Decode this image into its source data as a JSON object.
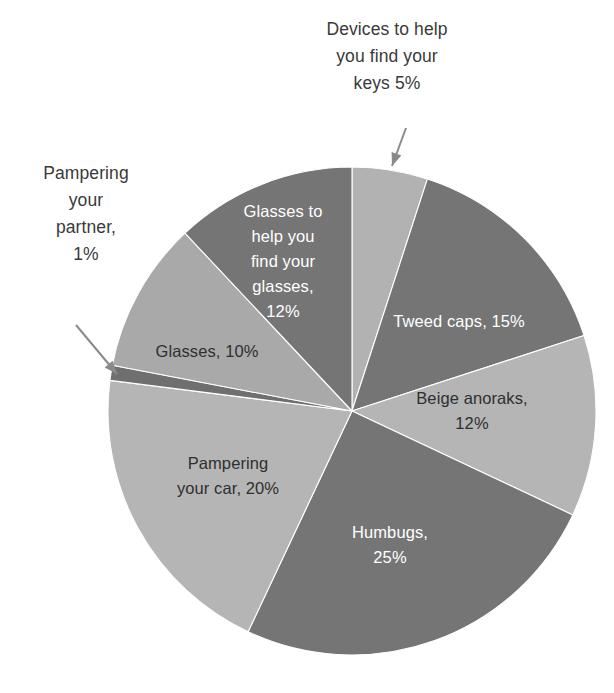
{
  "chart_data": {
    "type": "pie",
    "title": "",
    "subtitle": "",
    "xlabel": "",
    "ylabel": "",
    "legend_position": "none",
    "grid": false,
    "total": 100,
    "units": "%",
    "start_angle_deg": 0,
    "direction": "clockwise",
    "categories": [
      "Devices to help you find your keys",
      "Tweed caps",
      "Beige anoraks",
      "Humbugs",
      "Pampering your car",
      "Pampering your partner",
      "Glasses",
      "Glasses to help you find your glasses"
    ],
    "values": [
      5,
      15,
      12,
      25,
      20,
      1,
      10,
      12
    ],
    "slices": [
      {
        "name": "devices-to-help-you-find-your-keys",
        "label": "Devices to help\nyou find your\nkeys 5%",
        "value": 5,
        "color": "#b2b2b2",
        "label_placement": "callout",
        "label_color": "#3a3a3a",
        "label_x": 387,
        "label_y": 62,
        "label_lines": [
          "Devices to help",
          "you find your",
          "keys 5%"
        ],
        "leader": {
          "x1": 406,
          "y1": 128,
          "x2": 392,
          "y2": 166
        }
      },
      {
        "name": "tweed-caps",
        "label": "Tweed caps, 15%",
        "value": 15,
        "color": "#757575",
        "label_placement": "inside",
        "label_color": "#ffffff",
        "label_x": 459,
        "label_y": 323,
        "label_lines": [
          "Tweed caps, 15%"
        ]
      },
      {
        "name": "beige-anoraks",
        "label": "Beige anoraks, 12%",
        "value": 12,
        "color": "#b5b5b5",
        "label_placement": "inside",
        "label_color": "#2f2f2f",
        "label_x": 472,
        "label_y": 412,
        "label_lines": [
          "Beige anoraks,",
          "12%"
        ]
      },
      {
        "name": "humbugs",
        "label": "Humbugs, 25%",
        "value": 25,
        "color": "#757575",
        "label_placement": "inside",
        "label_color": "#ffffff",
        "label_x": 390,
        "label_y": 546,
        "label_lines": [
          "Humbugs,",
          "25%"
        ]
      },
      {
        "name": "pampering-your-car",
        "label": "Pampering your car, 20%",
        "value": 20,
        "color": "#b5b5b5",
        "label_placement": "inside",
        "label_color": "#2f2f2f",
        "label_x": 228,
        "label_y": 477,
        "label_lines": [
          "Pampering",
          "your car, 20%"
        ]
      },
      {
        "name": "pampering-your-partner",
        "label": "Pampering your partner, 1%",
        "value": 1,
        "color": "#6f6f6f",
        "label_placement": "callout",
        "label_color": "#3a3a3a",
        "label_x": 86,
        "label_y": 219,
        "label_lines": [
          "Pampering",
          "your",
          "partner,",
          "1%"
        ],
        "leader": {
          "x1": 76,
          "y1": 325,
          "x2": 117,
          "y2": 374
        }
      },
      {
        "name": "glasses",
        "label": "Glasses, 10%",
        "value": 10,
        "color": "#a9a9a9",
        "label_placement": "inside",
        "label_color": "#2f2f2f",
        "label_x": 207,
        "label_y": 353,
        "label_lines": [
          "Glasses, 10%"
        ]
      },
      {
        "name": "glasses-to-help-you-find-your-glasses",
        "label": "Glasses to help you find your glasses, 12%",
        "value": 12,
        "color": "#757575",
        "label_placement": "inside",
        "label_color": "#ffffff",
        "label_x": 283,
        "label_y": 263,
        "label_lines": [
          "Glasses to",
          "help you",
          "find your",
          "glasses,",
          "12%"
        ]
      }
    ],
    "geometry": {
      "cx": 352,
      "cy": 411,
      "r": 244
    }
  }
}
